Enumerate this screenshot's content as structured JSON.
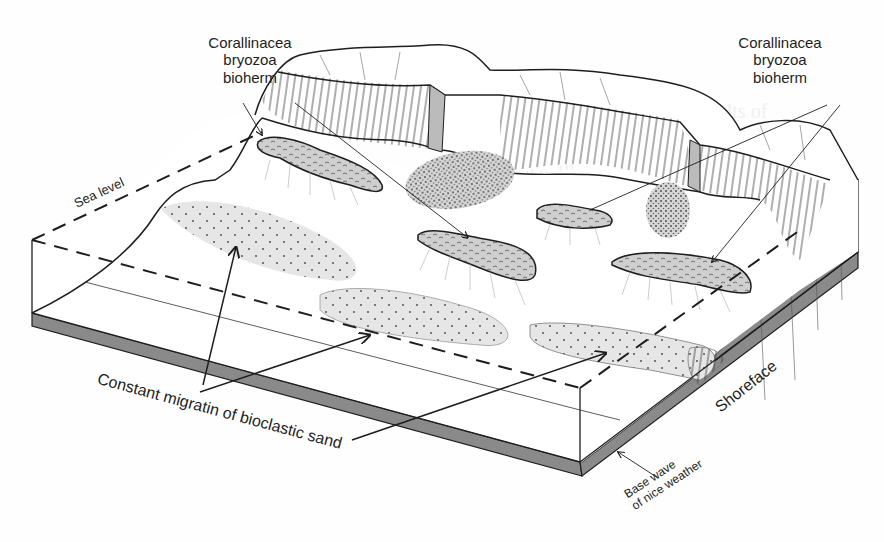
{
  "diagram": {
    "type": "geological block diagram",
    "labels": {
      "bioherm_left": [
        "Corallinacea",
        "bryozoa",
        "bioherm"
      ],
      "bioherm_right": [
        "Corallinacea",
        "bryozoa",
        "bioherm"
      ],
      "sea_level": "Sea level",
      "sand_migration": "Constant migratin of bioclastic sand",
      "shoreface": "Shoreface",
      "base_wave": [
        "Base wave",
        "of nice weather"
      ]
    },
    "features": [
      {
        "name": "bioherm",
        "count": 4,
        "fill": "grey stippled mounds with radiating debris"
      },
      {
        "name": "bioclastic-sand-body",
        "count": 4,
        "fill": "light grey dotted lenses"
      },
      {
        "name": "coastal-cliff",
        "fill": "hatched vertical lines"
      },
      {
        "name": "shoreface-slope",
        "fill": "dark grey"
      }
    ],
    "colors": {
      "line": "#1e1e1e",
      "sand": "#e4e4e4",
      "bioherm": "#cfcfcf",
      "dark_face": "#8a8a8a",
      "background": "#fefefe"
    }
  }
}
